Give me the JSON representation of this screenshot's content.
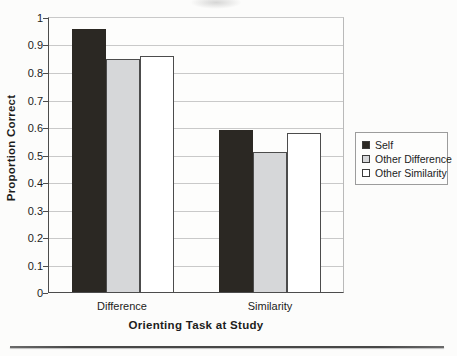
{
  "chart_data": {
    "type": "bar",
    "title": "",
    "categories": [
      "Difference",
      "Similarity"
    ],
    "series": [
      {
        "name": "Self",
        "values": [
          0.96,
          0.59
        ],
        "fill": "#2b2823",
        "border": "#2b2823"
      },
      {
        "name": "Other Difference",
        "values": [
          0.85,
          0.51
        ],
        "fill": "#d6d7d9",
        "border": "#4c4c4c"
      },
      {
        "name": "Other Similarity",
        "values": [
          0.86,
          0.58
        ],
        "fill": "#ffffff",
        "border": "#4c4c4c"
      }
    ],
    "xlabel": "Orienting Task at Study",
    "ylabel": "Proportion Correct",
    "ylim": [
      0,
      1
    ],
    "ytick_step": 0.1,
    "ytick_labels": [
      "1",
      "0.9",
      "0.8",
      "0.7",
      "0.6",
      "0.5",
      "0.4",
      "0.3",
      "0.2",
      "0.1",
      "0"
    ],
    "grid": "horizontal-on",
    "legend_position": "right"
  },
  "colors": {
    "gridline": "#c9c9c9",
    "axis": "#4c4c4c",
    "text": "#1c1c1c",
    "legend_border": "#9c9c9c",
    "divider": "#474747",
    "background": "#fcfcfb"
  }
}
